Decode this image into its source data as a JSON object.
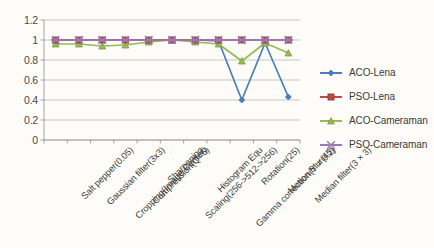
{
  "chart_data": {
    "type": "line",
    "title": "",
    "xlabel": "",
    "ylabel": "",
    "ylim": [
      0,
      1.2
    ],
    "ytick_step": 0.2,
    "grid": "horizontal",
    "legend_position": "right",
    "categories": [
      "Salt pepper(0.05)",
      "Gaussian filter(3x3)",
      "Cropping(Image Center)",
      "Compression(Q=5)",
      "Sharpening",
      "Scaling(256->512->256)",
      "Histogram Equ",
      "Gamma correction(Y = 0.2)",
      "Rotation(25)",
      "Motion Blur(45)",
      "Median filter(3 × 3)"
    ],
    "ytick_labels": [
      "0",
      "0.2",
      "0.4",
      "0.6",
      "0.8",
      "1",
      "1.2"
    ],
    "series": [
      {
        "name": "ACO-Lena",
        "color": "#4a7ebb",
        "marker": "diamond",
        "values": [
          1.0,
          1.0,
          1.0,
          1.0,
          1.0,
          1.0,
          1.0,
          0.99,
          0.4,
          0.97,
          0.43
        ]
      },
      {
        "name": "PSO-Lena",
        "color": "#be4b48",
        "marker": "square",
        "values": [
          1.0,
          1.0,
          1.0,
          1.0,
          1.0,
          1.0,
          1.0,
          1.0,
          1.0,
          1.0,
          1.0
        ]
      },
      {
        "name": "ACO-Cameraman",
        "color": "#98b954",
        "marker": "triangle",
        "values": [
          0.96,
          0.96,
          0.94,
          0.95,
          0.98,
          1.0,
          0.98,
          0.96,
          0.79,
          0.97,
          0.87
        ]
      },
      {
        "name": "PSO-Cameraman",
        "color": "#9c78b5",
        "marker": "cross",
        "values": [
          1.0,
          1.0,
          1.0,
          1.0,
          1.0,
          1.0,
          1.0,
          1.0,
          1.0,
          1.0,
          1.0
        ]
      }
    ]
  },
  "legend": {
    "items": [
      {
        "label": "ACO-Lena"
      },
      {
        "label": "PSO-Lena"
      },
      {
        "label": "ACO-Cameraman"
      },
      {
        "label": "PSO-Cameraman"
      }
    ]
  }
}
